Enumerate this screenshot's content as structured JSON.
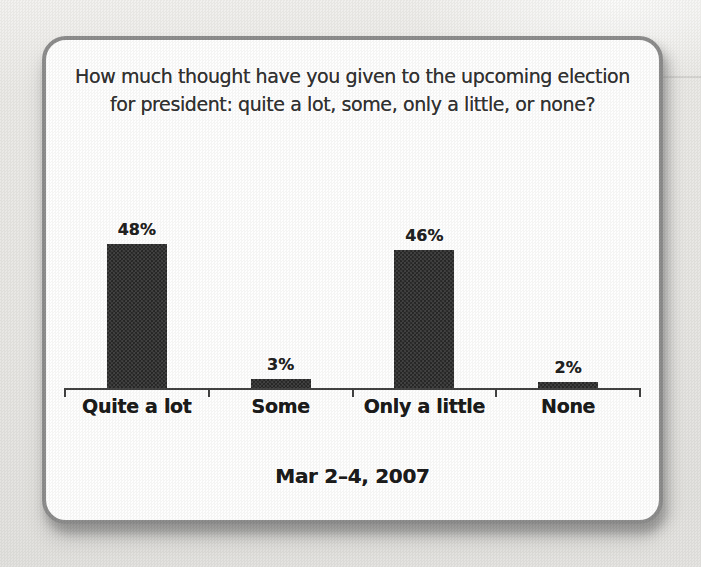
{
  "page": {
    "background_color": "#e8e7e4"
  },
  "card": {
    "title_lines": [
      "How much thought have you given to the upcoming election",
      "for president: quite a lot, some, only a little, or none?"
    ],
    "caption": "Mar 2–4, 2007",
    "border_color": "#8a8a8a",
    "background_color": "#fefefe"
  },
  "chart_data": {
    "type": "bar",
    "title": "How much thought have you given to the upcoming election for president: quite a lot, some, only a little, or none?",
    "categories": [
      "Quite a lot",
      "Some",
      "Only a little",
      "None"
    ],
    "values": [
      48,
      3,
      46,
      2
    ],
    "value_labels": [
      "48%",
      "3%",
      "46%",
      "2%"
    ],
    "caption": "Mar 2–4, 2007",
    "xlabel": "",
    "ylabel": "",
    "ylim": [
      0,
      52
    ],
    "grid": false,
    "legend": null,
    "bar_color": "#2c2c2c",
    "axis_color": "#3d3d3d",
    "value_label_color": "#1c1c1c",
    "category_label_color": "#161616"
  }
}
